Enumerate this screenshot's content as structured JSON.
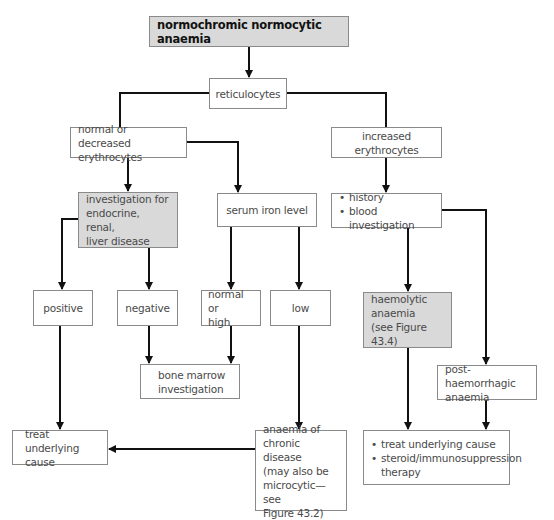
{
  "title": "normochromic normocytic anaemia",
  "nodes": {
    "reticulocytes": "reticulocytes",
    "normal_decreased": [
      "normal or",
      "decreased erythrocytes"
    ],
    "increased": "increased erythrocytes",
    "investigation": [
      "investigation for",
      "endocrine, renal,",
      "liver disease"
    ],
    "serum_iron": "serum iron level",
    "history_items": [
      "history",
      "blood investigation"
    ],
    "positive": "positive",
    "negative": "negative",
    "normal_high": [
      "normal or",
      "high"
    ],
    "low": "low",
    "bone_marrow": [
      "bone marrow",
      "investigation"
    ],
    "haemolytic": [
      "haemolytic",
      "anaemia",
      "(see Figure 43.4)"
    ],
    "post_haemorrhagic": [
      "post-haemorrhagic",
      "anaemia"
    ],
    "treat_underlying": [
      "treat underlying",
      "cause"
    ],
    "chronic_disease": [
      "anaemia of",
      "chronic disease",
      "(may also be",
      "microcytic—see",
      "Figure 43.2)"
    ],
    "treatment_items": [
      "treat underlying cause",
      "steroid/immunosuppression therapy"
    ]
  },
  "colors": {
    "box_border": "#8a8a8a",
    "grey_fill": "#d9d9d9",
    "line": "#111111"
  }
}
